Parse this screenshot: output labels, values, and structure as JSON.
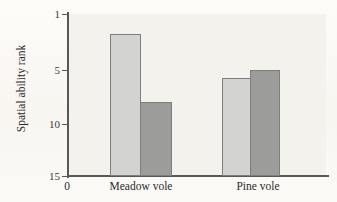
{
  "figure": {
    "background_color": "#f4f2ed",
    "cut_off_header_text": "",
    "origin_label": "0"
  },
  "chart_data": {
    "type": "bar",
    "title": "",
    "xlabel": "",
    "ylabel": "Spatial ability rank",
    "categories": [
      "Meadow vole",
      "Pine vole"
    ],
    "series": [
      {
        "name": "light-bar",
        "color": "#d3d3d1",
        "values": [
          2.7,
          6.5
        ]
      },
      {
        "name": "dark-bar",
        "color": "#9c9c9a",
        "values": [
          8.6,
          5.8
        ]
      }
    ],
    "yticks": [
      1,
      5,
      10,
      15
    ],
    "ytick_labels": [
      "1",
      "5",
      "10",
      "15"
    ],
    "ylim": [
      1,
      15
    ],
    "y_axis_inverted": true,
    "grid": false,
    "legend": "none"
  },
  "axis": {
    "y_title": "Spatial ability rank",
    "ticks": [
      {
        "label": "1",
        "value": 1
      },
      {
        "label": "5",
        "value": 5
      },
      {
        "label": "10",
        "value": 10
      },
      {
        "label": "15",
        "value": 15
      }
    ]
  },
  "bars": [
    {
      "group": "Meadow vole",
      "series": "light-bar",
      "value": 2.7,
      "color": "#d3d3d1"
    },
    {
      "group": "Meadow vole",
      "series": "dark-bar",
      "value": 8.6,
      "color": "#9c9c9a"
    },
    {
      "group": "Pine vole",
      "series": "light-bar",
      "value": 6.5,
      "color": "#d3d3d1"
    },
    {
      "group": "Pine vole",
      "series": "dark-bar",
      "value": 5.8,
      "color": "#9c9c9a"
    }
  ],
  "category_labels": [
    "Meadow vole",
    "Pine vole"
  ]
}
